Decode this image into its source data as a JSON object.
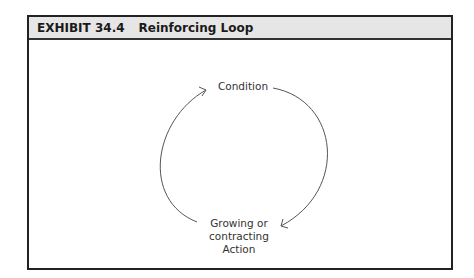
{
  "exhibit": {
    "number": "EXHIBIT 34.4",
    "title": "Reinforcing Loop"
  },
  "diagram": {
    "type": "reinforcing-loop",
    "nodes": [
      {
        "id": "condition",
        "label": "Condition"
      },
      {
        "id": "action",
        "label_lines": [
          "Growing or",
          "contracting",
          "Action"
        ]
      }
    ],
    "edges": [
      {
        "from": "condition",
        "to": "action",
        "side": "right"
      },
      {
        "from": "action",
        "to": "condition",
        "side": "left"
      }
    ],
    "line_color": "#555555"
  }
}
